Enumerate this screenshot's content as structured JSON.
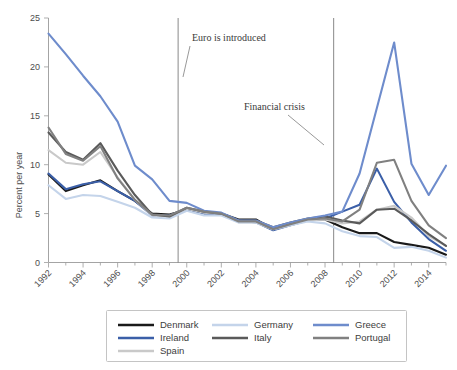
{
  "chart_data": {
    "type": "line",
    "title": "",
    "xlabel": "",
    "ylabel": "Percent per year",
    "xlim": [
      1992,
      2015
    ],
    "ylim": [
      0,
      25
    ],
    "yticks": [
      0,
      5,
      10,
      15,
      20,
      25
    ],
    "xticks": [
      1992,
      1994,
      1996,
      1998,
      2000,
      2002,
      2004,
      2006,
      2008,
      2010,
      2012,
      2014
    ],
    "x": [
      1992,
      1993,
      1994,
      1995,
      1996,
      1997,
      1998,
      1999,
      2000,
      2001,
      2002,
      2003,
      2004,
      2005,
      2006,
      2007,
      2008,
      2009,
      2010,
      2011,
      2012,
      2013,
      2014,
      2015
    ],
    "grid": false,
    "legend_position": "bottom",
    "series": [
      {
        "name": "Denmark",
        "color": "#1a1a1a",
        "values": [
          9.0,
          7.3,
          7.9,
          8.4,
          7.3,
          6.3,
          5.0,
          4.9,
          5.4,
          5.1,
          5.0,
          4.4,
          4.4,
          3.4,
          4.0,
          4.4,
          4.4,
          3.6,
          3.0,
          3.0,
          2.1,
          1.8,
          1.5,
          0.8
        ]
      },
      {
        "name": "Ireland",
        "color": "#3b5fa8",
        "values": [
          9.1,
          7.5,
          8.0,
          8.3,
          7.3,
          6.3,
          4.8,
          4.8,
          5.5,
          5.0,
          5.0,
          4.3,
          4.1,
          3.3,
          3.8,
          4.3,
          4.5,
          5.2,
          5.9,
          9.6,
          6.2,
          4.1,
          2.4,
          1.2
        ]
      },
      {
        "name": "Spain",
        "color": "#c9c9c9",
        "values": [
          11.5,
          10.2,
          10.0,
          11.3,
          8.7,
          6.4,
          4.8,
          4.7,
          5.5,
          5.1,
          5.0,
          4.1,
          4.1,
          3.4,
          3.8,
          4.3,
          4.4,
          4.0,
          4.2,
          5.4,
          5.8,
          4.6,
          2.7,
          1.7
        ]
      },
      {
        "name": "Germany",
        "color": "#c4d4ea",
        "values": [
          7.9,
          6.5,
          6.9,
          6.8,
          6.2,
          5.6,
          4.6,
          4.5,
          5.3,
          4.8,
          4.8,
          4.1,
          4.1,
          3.4,
          3.8,
          4.2,
          4.0,
          3.2,
          2.7,
          2.6,
          1.5,
          1.6,
          1.2,
          0.5
        ]
      },
      {
        "name": "Italy",
        "color": "#5a5a5a",
        "values": [
          13.3,
          11.3,
          10.5,
          12.2,
          9.4,
          6.9,
          4.9,
          4.7,
          5.6,
          5.2,
          5.0,
          4.3,
          4.3,
          3.6,
          4.1,
          4.5,
          4.7,
          4.3,
          4.0,
          5.4,
          5.5,
          4.3,
          2.9,
          1.7
        ]
      },
      {
        "name": "Greece",
        "color": "#6e8ccc",
        "values": [
          23.4,
          21.3,
          19.1,
          17.0,
          14.4,
          9.9,
          8.5,
          6.3,
          6.1,
          5.3,
          5.1,
          4.3,
          4.3,
          3.6,
          4.1,
          4.5,
          4.8,
          5.2,
          9.1,
          15.8,
          22.5,
          10.1,
          6.9,
          9.9
        ]
      },
      {
        "name": "Portugal",
        "color": "#808080",
        "values": [
          13.8,
          11.1,
          10.4,
          11.9,
          8.6,
          6.4,
          4.9,
          4.8,
          5.6,
          5.2,
          5.0,
          4.2,
          4.2,
          3.4,
          3.9,
          4.4,
          4.5,
          4.2,
          5.4,
          10.2,
          10.5,
          6.3,
          3.8,
          2.5
        ]
      }
    ],
    "annotations": [
      {
        "name": "euro-introduced",
        "label": "Euro is introduced",
        "year": 1999.5,
        "label_x": 192,
        "label_y": 41,
        "leader": {
          "x1": 190,
          "y1": 46,
          "x2": 183,
          "y2": 77
        }
      },
      {
        "name": "financial-crisis",
        "label": "Financial crisis",
        "year": 2008.5,
        "label_x": 244,
        "label_y": 110,
        "leader": {
          "x1": 288,
          "y1": 115,
          "x2": 324,
          "y2": 145
        }
      }
    ]
  },
  "legend": {
    "items": [
      {
        "label": "Denmark",
        "color": "#1a1a1a"
      },
      {
        "label": "Germany",
        "color": "#c4d4ea"
      },
      {
        "label": "Greece",
        "color": "#6e8ccc"
      },
      {
        "label": "Ireland",
        "color": "#3b5fa8"
      },
      {
        "label": "Italy",
        "color": "#5a5a5a"
      },
      {
        "label": "Portugal",
        "color": "#808080"
      },
      {
        "label": "Spain",
        "color": "#c9c9c9"
      }
    ]
  }
}
